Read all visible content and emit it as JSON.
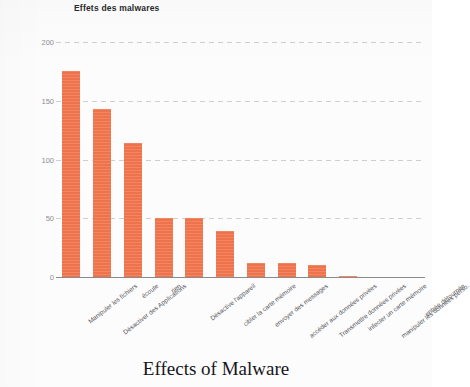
{
  "chart_data": {
    "type": "bar",
    "title": "Effets des malwares",
    "subtitle": "",
    "xlabel": "",
    "ylabel": "Count",
    "ylim": [
      0,
      200
    ],
    "yticks": [
      0,
      50,
      100,
      150,
      200
    ],
    "grid": true,
    "legend": null,
    "bar_color": "#f4774e",
    "categories": [
      "Manipuler les fichiers",
      "Désactiver des Applications",
      "écoute",
      "rien",
      "Désactive l'appareil",
      "cibler la carte mémoire",
      "envoyer des messages",
      "accéder aux données privées",
      "Transmettre données privées",
      "infecter un carte mémoire",
      "manipuler les données perso.",
      "entrée détournée"
    ],
    "values": [
      175,
      143,
      114,
      50,
      50,
      39,
      12,
      12,
      10,
      1,
      0,
      0
    ]
  },
  "caption": {
    "text": "Effects of Malware"
  },
  "axis": {
    "ytick_labels": [
      "0",
      "50",
      "100",
      "150",
      "200"
    ]
  }
}
